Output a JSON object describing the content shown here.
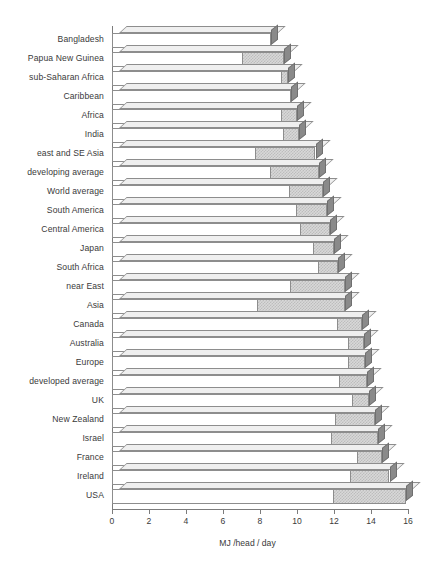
{
  "chart": {
    "type": "bar",
    "orientation": "horizontal",
    "xlabel": "MJ /head / day",
    "ylabel": "",
    "title": "",
    "xlim": [
      0,
      16
    ],
    "xticks": [
      0,
      2,
      4,
      6,
      8,
      10,
      12,
      14,
      16
    ],
    "xtick_labels": [
      "0",
      "2",
      "4",
      "6",
      "8",
      "10",
      "12",
      "14",
      "16"
    ],
    "grid": false,
    "legend": "none",
    "style": "3d-stacked-horizontal-bar"
  },
  "chart_data": {
    "type": "bar",
    "orientation": "horizontal",
    "title": "",
    "xlabel": "MJ /head / day",
    "ylabel": "",
    "xlim": [
      0,
      16
    ],
    "xticks": [
      0,
      2,
      4,
      6,
      8,
      10,
      12,
      14,
      16
    ],
    "grid": false,
    "legend": "none",
    "categories": [
      "Bangladesh",
      "Papua New Guinea",
      "sub-Saharan Africa",
      "Caribbean",
      "Africa",
      "India",
      "east and SE Asia",
      "developing average",
      "World average",
      "South America",
      "Central America",
      "Japan",
      "South Africa",
      "near East",
      "Asia",
      "Canada",
      "Australia",
      "Europe",
      "developed average",
      "UK",
      "New Zealand",
      "Israel",
      "France",
      "Ireland",
      "USA"
    ],
    "series": [
      {
        "name": "lower segment",
        "fill": "white",
        "values": [
          8.6,
          7.1,
          9.2,
          9.7,
          9.2,
          9.3,
          7.8,
          8.6,
          9.6,
          10.0,
          10.2,
          10.9,
          11.2,
          9.7,
          7.9,
          12.2,
          12.8,
          12.8,
          12.3,
          13.0,
          12.1,
          11.9,
          13.3,
          12.9,
          12.0
        ]
      },
      {
        "name": "upper segment",
        "fill": "gray-hatch",
        "values": [
          0.0,
          2.2,
          0.3,
          0.0,
          0.8,
          0.8,
          3.2,
          2.6,
          1.8,
          1.6,
          1.6,
          1.1,
          1.0,
          2.9,
          4.7,
          1.3,
          0.8,
          0.9,
          1.5,
          0.9,
          2.1,
          2.5,
          1.3,
          2.1,
          3.9
        ]
      }
    ],
    "totals": [
      8.6,
      9.3,
      9.5,
      9.7,
      10.0,
      10.1,
      11.0,
      11.2,
      11.4,
      11.6,
      11.8,
      12.0,
      12.2,
      12.6,
      12.6,
      13.5,
      13.6,
      13.7,
      13.8,
      13.9,
      14.2,
      14.4,
      14.6,
      15.0,
      15.9
    ]
  },
  "colors": {
    "white_segment": "#ffffff",
    "hatch_segment": "#d8d8d8",
    "side_face": "#8a8a8a",
    "outline": "#8d8d8d",
    "axis": "#7c7c7c",
    "text": "#3a3a3a",
    "background": "#ffffff"
  }
}
